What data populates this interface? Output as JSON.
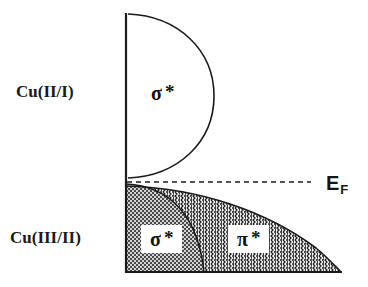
{
  "figure": {
    "type": "band-diagram",
    "background_color": "#ffffff",
    "line_color": "#1a1a1a"
  },
  "axis": {
    "vertical_axis_x": 126,
    "vertical_axis_top_y": 14,
    "vertical_axis_bottom_y": 272,
    "baseline_y": 272,
    "baseline_x_end": 341
  },
  "labels": {
    "upper_band_label": "Cu(II/I)",
    "lower_band_label": "Cu(III/II)",
    "fermi_symbol": "E",
    "fermi_subscript": "F"
  },
  "bands": [
    {
      "id": "upper-band",
      "row_label": "Cu(II/I)",
      "orbital_symbol": "σ",
      "orbital_star": "*",
      "orbital_label": "σ*",
      "fill": "none",
      "fill_color": "#ffffff",
      "shape": "half-ellipse",
      "top_y": 14,
      "bottom_y": 178,
      "max_extent_x": 214,
      "occupied": false
    },
    {
      "id": "lower-band",
      "row_label": "Cu(III/II)",
      "occupied": true,
      "top_y": 186,
      "bottom_y": 272,
      "max_extent_x": 341,
      "subbands": [
        {
          "id": "sigma-subband",
          "orbital_symbol": "σ",
          "orbital_star": "*",
          "orbital_label": "σ*",
          "texture": "fine-dotted-checker",
          "texture_color": "#3a3a3a",
          "fill_color": "#c9c9c9",
          "x_start": 126,
          "x_end": 212
        },
        {
          "id": "pi-subband",
          "orbital_symbol": "π",
          "orbital_star": "*",
          "orbital_label": "π*",
          "texture": "vertical-wavy-zigzag",
          "texture_color": "#1f1f1f",
          "fill_color": "#ffffff",
          "x_start": 202,
          "x_end": 341
        }
      ]
    }
  ],
  "fermi_level": {
    "label": "E_F",
    "style": "dashed",
    "y": 182,
    "x_start": 127,
    "x_end": 311,
    "color": "#1a1a1a",
    "dash_pattern": "5,4"
  }
}
